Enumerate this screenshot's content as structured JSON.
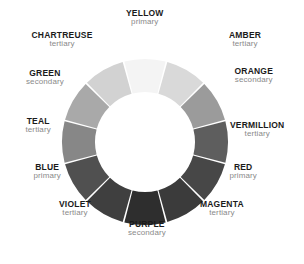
{
  "figure": {
    "center_x": 145,
    "center_y": 142,
    "outer_radius": 83,
    "inner_radius": 50,
    "gap_degrees": 1.2,
    "background": "#ffffff",
    "name_color": "#1b1b1b",
    "category_color": "#8a8a8a"
  },
  "chart_data": {
    "type": "pie",
    "subtype": "donut",
    "segments_total": 12,
    "equal_segments": true,
    "segment_degrees": 30,
    "start_angle_top": true,
    "categories": [
      "YELLOW",
      "AMBER",
      "ORANGE",
      "VERMILLION",
      "RED",
      "MAGENTA",
      "PURPLE",
      "VIOLET",
      "BLUE",
      "TEAL",
      "GREEN",
      "CHARTREUSE"
    ],
    "values": [
      1,
      1,
      1,
      1,
      1,
      1,
      1,
      1,
      1,
      1,
      1,
      1
    ],
    "series": [
      {
        "name": "Color role",
        "values": [
          "primary",
          "tertiary",
          "secondary",
          "tertiary",
          "primary",
          "tertiary",
          "secondary",
          "tertiary",
          "primary",
          "tertiary",
          "secondary",
          "tertiary"
        ]
      }
    ],
    "legend": "none",
    "grid": false
  },
  "segments": [
    {
      "name": "YELLOW",
      "category": "primary",
      "fill": "#f4f4f4",
      "start_angle": -15,
      "end_angle": 15,
      "label_x": 145,
      "label_y": 18,
      "label_anchor": "center"
    },
    {
      "name": "AMBER",
      "category": "tertiary",
      "fill": "#d9d9d9",
      "start_angle": 15,
      "end_angle": 45,
      "label_x": 245,
      "label_y": 40,
      "label_anchor": "center"
    },
    {
      "name": "ORANGE",
      "category": "secondary",
      "fill": "#9b9b9b",
      "start_angle": 45,
      "end_angle": 75,
      "label_x": 254,
      "label_y": 76,
      "label_anchor": "center"
    },
    {
      "name": "VERMILLION",
      "category": "tertiary",
      "fill": "#5e5e5e",
      "start_angle": 75,
      "end_angle": 105,
      "label_x": 257,
      "label_y": 130,
      "label_anchor": "center"
    },
    {
      "name": "RED",
      "category": "primary",
      "fill": "#474747",
      "start_angle": 105,
      "end_angle": 135,
      "label_x": 243,
      "label_y": 172,
      "label_anchor": "center"
    },
    {
      "name": "MAGENTA",
      "category": "tertiary",
      "fill": "#3b3b3b",
      "start_angle": 135,
      "end_angle": 165,
      "label_x": 222,
      "label_y": 209,
      "label_anchor": "center"
    },
    {
      "name": "PURPLE",
      "category": "secondary",
      "fill": "#2e2e2e",
      "start_angle": 165,
      "end_angle": 195,
      "label_x": 147,
      "label_y": 229,
      "label_anchor": "center"
    },
    {
      "name": "VIOLET",
      "category": "tertiary",
      "fill": "#3f3f3f",
      "start_angle": 195,
      "end_angle": 225,
      "label_x": 75,
      "label_y": 209,
      "label_anchor": "center"
    },
    {
      "name": "BLUE",
      "category": "primary",
      "fill": "#505050",
      "start_angle": 225,
      "end_angle": 255,
      "label_x": 47,
      "label_y": 172,
      "label_anchor": "center"
    },
    {
      "name": "TEAL",
      "category": "tertiary",
      "fill": "#878787",
      "start_angle": 255,
      "end_angle": 285,
      "label_x": 38,
      "label_y": 126,
      "label_anchor": "center"
    },
    {
      "name": "GREEN",
      "category": "secondary",
      "fill": "#a9a9a9",
      "start_angle": 285,
      "end_angle": 315,
      "label_x": 45,
      "label_y": 78,
      "label_anchor": "center"
    },
    {
      "name": "CHARTREUSE",
      "category": "tertiary",
      "fill": "#d2d2d2",
      "start_angle": 315,
      "end_angle": 345,
      "label_x": 62,
      "label_y": 40,
      "label_anchor": "center"
    }
  ]
}
